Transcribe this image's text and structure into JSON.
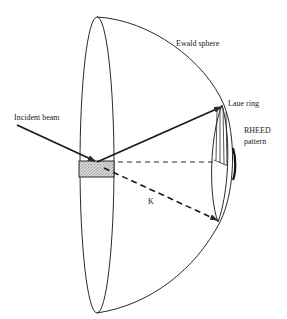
{
  "diagram": {
    "labels": {
      "ewald_sphere": "Ewald sphere",
      "laue_ring": "Laue ring",
      "rheed_line1": "RHEED",
      "rheed_line2": "pattern",
      "incident_beam": "Incident beam",
      "k_vector": "K"
    },
    "colors": {
      "stroke": "#2a2a2a",
      "sample_fill": "#cfcfcf",
      "background": "#ffffff"
    }
  }
}
